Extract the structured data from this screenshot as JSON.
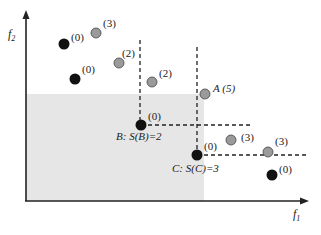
{
  "diagram": {
    "axes": {
      "x_label": "f",
      "x_sub": "1",
      "y_label": "f",
      "y_sub": "2"
    },
    "colors": {
      "nondominated_point": "#111111",
      "dominated_point": "#9a9a9a",
      "shaded_region": "#e6e6e6",
      "axis": "#222222"
    },
    "points": [
      {
        "kind": "nondominated",
        "x": 64,
        "y": 44,
        "label": "(0)"
      },
      {
        "kind": "dominated",
        "x": 96,
        "y": 33,
        "label": "(3)"
      },
      {
        "kind": "nondominated",
        "x": 75,
        "y": 79,
        "label": "(0)"
      },
      {
        "kind": "dominated",
        "x": 119,
        "y": 63,
        "label": "(2)"
      },
      {
        "kind": "dominated",
        "x": 152,
        "y": 82,
        "label": "(2)"
      },
      {
        "kind": "dominated",
        "x": 205,
        "y": 94,
        "label": "A (5)"
      },
      {
        "kind": "nondominated",
        "x": 141,
        "y": 125,
        "label": "(0)"
      },
      {
        "kind": "nondominated",
        "x": 197,
        "y": 155,
        "label": "(0)"
      },
      {
        "kind": "dominated",
        "x": 231,
        "y": 140,
        "label": "(3)"
      },
      {
        "kind": "dominated",
        "x": 268,
        "y": 152,
        "label": "(3)"
      },
      {
        "kind": "nondominated",
        "x": 272,
        "y": 175,
        "label": "(0)"
      }
    ],
    "annotations": {
      "B": "B: S(B)=2",
      "C": "C: S(C)=3"
    }
  }
}
